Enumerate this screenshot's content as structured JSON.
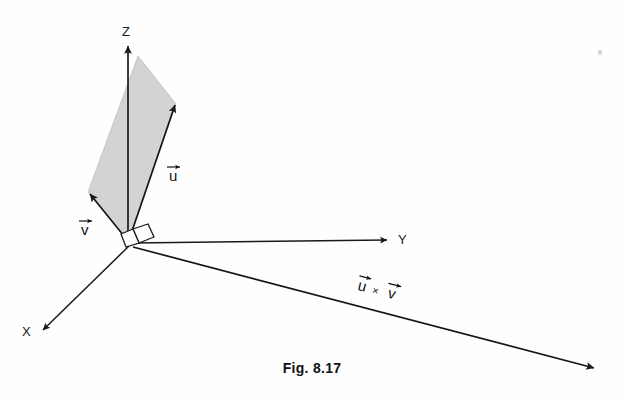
{
  "figure": {
    "caption": "Fig. 8.17",
    "background_color": "#fefefe",
    "line_color": "#1a1a1a",
    "fill_color": "#d3d3d3",
    "axes": [
      {
        "name": "x-axis",
        "label": "X",
        "label_x": 22,
        "label_y": 336,
        "direction": "down-left"
      },
      {
        "name": "y-axis",
        "label": "Y",
        "label_x": 398,
        "label_y": 244,
        "direction": "right"
      },
      {
        "name": "z-axis",
        "label": "Z",
        "label_x": 126,
        "label_y": 36,
        "direction": "up"
      }
    ],
    "vectors": [
      {
        "name": "vector-u",
        "label": "u",
        "accent": "arrow-overbar",
        "label_x": 170,
        "label_y": 180
      },
      {
        "name": "vector-v",
        "label": "v",
        "accent": "arrow-overbar",
        "label_x": 81,
        "label_y": 235
      },
      {
        "name": "vector-cross-product",
        "label_u": "u",
        "label_times": "×",
        "label_v": "v",
        "accent": "arrow-overbar",
        "label_x": 358,
        "label_y": 298
      }
    ],
    "right_angle_marker": {
      "name": "right-angle-marker",
      "present": true
    },
    "parallelogram": {
      "name": "uv-parallelogram",
      "fill": "#d3d3d3",
      "vertices": [
        [
          128,
          241
        ],
        [
          88,
          192
        ],
        [
          138,
          56
        ],
        [
          176,
          104
        ]
      ]
    }
  }
}
